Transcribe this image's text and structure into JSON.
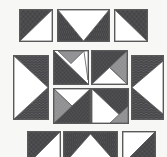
{
  "figure": {
    "background_color": "#f7f7f5",
    "outline_color": "#5a5a5a",
    "fills": {
      "dark": "#3f3f42",
      "dark_dot": "#8f8f93",
      "gray": "#9a9a9c",
      "gray_dot": "#6e6e70",
      "white": "#ffffff"
    }
  },
  "pieces": [
    {
      "id": "piece-1",
      "name": "top-left-square",
      "shape": "square",
      "x": 19,
      "y": 9,
      "w": 34,
      "h": 33,
      "regions": [
        {
          "name": "upper-left-triangle",
          "fill": "dark",
          "points": "0,0 100,0 0,100"
        },
        {
          "name": "lower-right-triangle",
          "fill": "white",
          "points": "100,0 100,100 0,100"
        }
      ]
    },
    {
      "id": "piece-2",
      "name": "top-middle-rectangle",
      "shape": "rectangle",
      "x": 57,
      "y": 9,
      "w": 53,
      "h": 33,
      "regions": [
        {
          "name": "left-dark-triangle",
          "fill": "dark",
          "points": "0,0 0,100 50,100"
        },
        {
          "name": "right-dark-triangle",
          "fill": "dark",
          "points": "100,0 100,100 50,100"
        },
        {
          "name": "white-down-triangle",
          "fill": "white",
          "points": "0,0 100,0 50,100"
        }
      ]
    },
    {
      "id": "piece-3",
      "name": "top-right-square",
      "shape": "square",
      "x": 114,
      "y": 9,
      "w": 34,
      "h": 33,
      "regions": [
        {
          "name": "upper-right-triangle",
          "fill": "dark",
          "points": "0,0 100,0 100,100"
        },
        {
          "name": "lower-left-triangle",
          "fill": "white",
          "points": "0,0 100,100 0,100"
        }
      ]
    },
    {
      "id": "piece-4",
      "name": "middle-left-tall-rectangle",
      "shape": "rectangle",
      "x": 13,
      "y": 55,
      "w": 36,
      "h": 65,
      "regions": [
        {
          "name": "upper-dark-triangle",
          "fill": "dark",
          "points": "0,0 100,0 100,50"
        },
        {
          "name": "lower-dark-triangle",
          "fill": "dark",
          "points": "0,100 100,100 100,50"
        },
        {
          "name": "white-right-triangle",
          "fill": "white",
          "points": "0,0 100,50 0,100"
        }
      ]
    },
    {
      "id": "piece-5",
      "name": "middle-upper-left-square",
      "shape": "square",
      "x": 53,
      "y": 50,
      "w": 36,
      "h": 35,
      "regions": [
        {
          "name": "lower-left-dark-triangle",
          "fill": "dark",
          "points": "0,0 0,100 100,100"
        },
        {
          "name": "top-gray-triangle",
          "fill": "gray",
          "points": "12,0 88,0 50,38"
        },
        {
          "name": "white-right-wedge",
          "fill": "white",
          "points": "88,0 100,0 100,88"
        }
      ]
    },
    {
      "id": "piece-6",
      "name": "middle-upper-right-square",
      "shape": "square",
      "x": 91,
      "y": 50,
      "w": 37,
      "h": 35,
      "regions": [
        {
          "name": "upper-left-dark-triangle",
          "fill": "dark",
          "points": "0,0 100,0 0,100"
        },
        {
          "name": "upper-right-gray-triangle",
          "fill": "gray",
          "points": "100,0 100,100 50,50"
        },
        {
          "name": "bottom-dark-triangle",
          "fill": "dark",
          "points": "0,100 100,100 50,50"
        },
        {
          "name": "white-center-wedge",
          "fill": "white",
          "points": "0,100 50,50 100,100"
        }
      ]
    },
    {
      "id": "piece-7",
      "name": "middle-right-tall-rectangle",
      "shape": "rectangle",
      "x": 131,
      "y": 55,
      "w": 33,
      "h": 65,
      "regions": [
        {
          "name": "dark-background",
          "fill": "dark",
          "points": "0,0 100,0 100,100 0,100"
        },
        {
          "name": "white-left-triangle",
          "fill": "white",
          "points": "100,8 0,50 100,92"
        }
      ]
    },
    {
      "id": "piece-8",
      "name": "middle-lower-left-square",
      "shape": "square",
      "x": 53,
      "y": 88,
      "w": 38,
      "h": 36,
      "regions": [
        {
          "name": "right-dark-triangle",
          "fill": "dark",
          "points": "0,100 100,0 100,100"
        },
        {
          "name": "top-white-triangle",
          "fill": "white",
          "points": "0,0 100,0 50,50"
        },
        {
          "name": "left-gray-triangle",
          "fill": "gray",
          "points": "0,0 50,50 0,100"
        }
      ]
    },
    {
      "id": "piece-9",
      "name": "middle-lower-right-square",
      "shape": "square",
      "x": 91,
      "y": 88,
      "w": 38,
      "h": 36,
      "regions": [
        {
          "name": "upper-right-dark-triangle",
          "fill": "dark",
          "points": "0,0 100,0 100,100"
        },
        {
          "name": "left-white-triangle",
          "fill": "white",
          "points": "0,0 100,100 0,100"
        },
        {
          "name": "bottom-gray-triangle",
          "fill": "gray",
          "points": "50,100 100,50 100,100"
        }
      ]
    },
    {
      "id": "piece-10",
      "name": "bottom-left-square",
      "shape": "square",
      "x": 27,
      "y": 131,
      "w": 34,
      "h": 34,
      "regions": [
        {
          "name": "upper-left-triangle",
          "fill": "dark",
          "points": "0,0 100,0 0,100"
        },
        {
          "name": "lower-right-triangle",
          "fill": "white",
          "points": "100,0 100,100 0,100"
        }
      ]
    },
    {
      "id": "piece-11",
      "name": "bottom-middle-rectangle",
      "shape": "rectangle",
      "x": 63,
      "y": 131,
      "w": 55,
      "h": 34,
      "regions": [
        {
          "name": "dark-background",
          "fill": "dark",
          "points": "0,0 100,0 100,100 0,100"
        },
        {
          "name": "white-up-triangle",
          "fill": "white",
          "points": "50,6 100,100 0,100"
        }
      ]
    },
    {
      "id": "piece-12",
      "name": "bottom-right-square",
      "shape": "square",
      "x": 122,
      "y": 131,
      "w": 34,
      "h": 34,
      "regions": [
        {
          "name": "upper-right-white-area",
          "fill": "white",
          "points": "0,0 100,0 0,100"
        },
        {
          "name": "lower-right-dark-triangle",
          "fill": "dark",
          "points": "100,0 100,100 0,100"
        }
      ]
    }
  ]
}
